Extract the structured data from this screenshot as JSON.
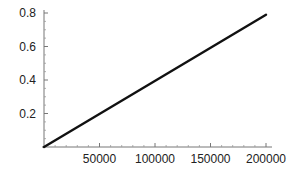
{
  "chart_data": {
    "type": "line",
    "title": "",
    "xlabel": "",
    "ylabel": "",
    "xlim": [
      0,
      205000
    ],
    "ylim": [
      0,
      0.82
    ],
    "grid": false,
    "legend": null,
    "x_ticks": [
      50000,
      100000,
      150000,
      200000
    ],
    "x_tick_labels": [
      "50000",
      "100000",
      "150000",
      "200000"
    ],
    "y_ticks": [
      0.2,
      0.4,
      0.6,
      0.8
    ],
    "y_tick_labels": [
      "0.2",
      "0.4",
      "0.6",
      "0.8"
    ],
    "series": [
      {
        "name": "line",
        "color": "#111111",
        "x": [
          0,
          200000
        ],
        "y": [
          0,
          0.79
        ]
      }
    ]
  }
}
